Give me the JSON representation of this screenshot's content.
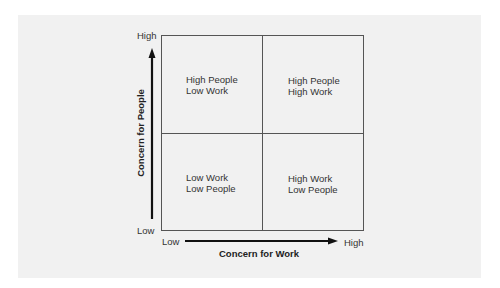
{
  "diagram": {
    "type": "2x2 quadrant matrix",
    "y_axis": {
      "title": "Concern for People",
      "low_label": "Low",
      "high_label": "High"
    },
    "x_axis": {
      "title": "Concern for Work",
      "low_label": "Low",
      "high_label": "High"
    },
    "quadrants": {
      "top_left": {
        "line1": "High People",
        "line2": "Low Work"
      },
      "top_right": {
        "line1": "High People",
        "line2": "High Work"
      },
      "bottom_left": {
        "line1": "Low Work",
        "line2": "Low People"
      },
      "bottom_right": {
        "line1": "High Work",
        "line2": "Low People"
      }
    },
    "colors": {
      "background": "#ffffff",
      "panel": "#f1f1f1",
      "lines": "#555555",
      "arrows": "#111111",
      "text": "#2a2a2a"
    }
  }
}
